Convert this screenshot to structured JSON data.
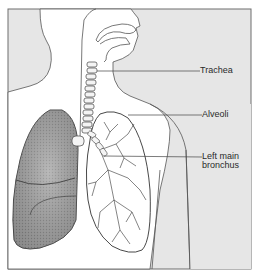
{
  "diagram": {
    "labels": {
      "trachea": "Trachea",
      "alveoli": "Alveoli",
      "left_main_bronchus_line1": "Left main",
      "left_main_bronchus_line2": "bronchus"
    }
  },
  "colors": {
    "background": "#e6e6e6",
    "body_fill": "#ffffff",
    "outline": "#555555",
    "lung_shaded": "#9a9a9a",
    "lung_line": "#333333"
  }
}
